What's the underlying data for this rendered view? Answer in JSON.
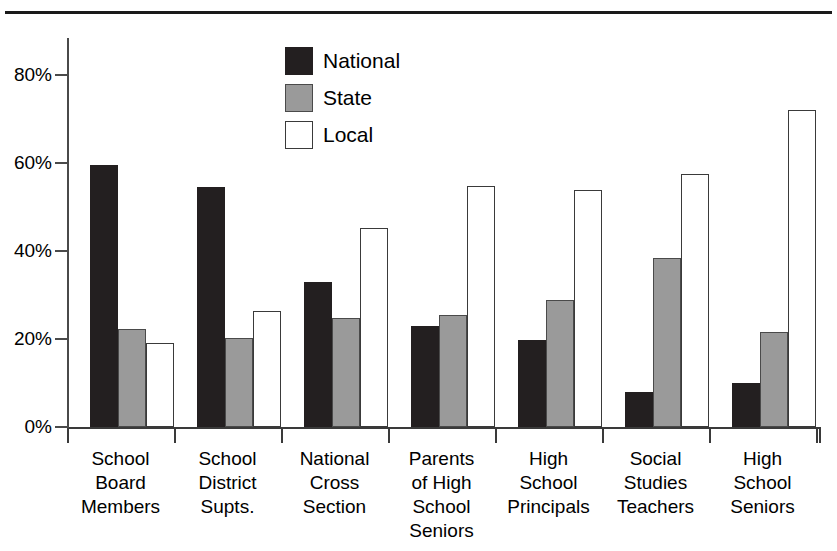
{
  "decor": {
    "top_rule": "horizontal-rule"
  },
  "legend": {
    "position": "top-center",
    "items": [
      {
        "label": "National",
        "swatch": "black-filled-square",
        "color": "#231f20"
      },
      {
        "label": "State",
        "swatch": "gray-filled-square",
        "color": "#9a9a9a"
      },
      {
        "label": "Local",
        "swatch": "white-outlined-square",
        "color": "#ffffff"
      }
    ]
  },
  "axis": {
    "y_tick_labels": [
      "0%",
      "20%",
      "40%",
      "60%",
      "80%"
    ],
    "y_tick_values": [
      0,
      20,
      40,
      60,
      80
    ]
  },
  "chart_data": {
    "type": "bar",
    "title": "",
    "subtitle": "",
    "xlabel": "",
    "ylabel": "",
    "ylim": [
      0,
      90
    ],
    "grid": false,
    "legend_position": "top-center",
    "categories": [
      "School Board Members",
      "School District Supts.",
      "National Cross Section",
      "Parents of High School Seniors",
      "High School Principals",
      "Social Studies Teachers",
      "High School Seniors"
    ],
    "category_label_lines": [
      [
        "School",
        "Board",
        "Members"
      ],
      [
        "School",
        "District",
        "Supts."
      ],
      [
        "National",
        "Cross",
        "Section"
      ],
      [
        "Parents",
        "of High",
        "School",
        "Seniors"
      ],
      [
        "High",
        "School",
        "Principals"
      ],
      [
        "Social",
        "Studies",
        "Teachers"
      ],
      [
        "High",
        "School",
        "Seniors"
      ]
    ],
    "series": [
      {
        "name": "National",
        "color": "#231f20",
        "values": [
          59.5,
          54.5,
          33.0,
          23.0,
          19.8,
          8.0,
          10.0
        ]
      },
      {
        "name": "State",
        "color": "#9a9a9a",
        "values": [
          22.3,
          20.3,
          24.8,
          25.5,
          28.8,
          38.3,
          21.5
        ]
      },
      {
        "name": "Local",
        "color": "#ffffff",
        "values": [
          19.0,
          26.3,
          45.3,
          54.8,
          53.8,
          57.5,
          72.0
        ]
      }
    ],
    "y_tick_labels": [
      "0%",
      "20%",
      "40%",
      "60%",
      "80%"
    ],
    "y_tick_values": [
      0,
      20,
      40,
      60,
      80
    ],
    "value_unit": "percent"
  }
}
